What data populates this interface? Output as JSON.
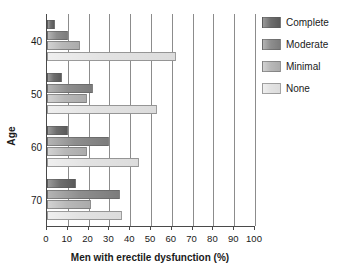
{
  "chart_data": {
    "type": "bar",
    "orientation": "horizontal",
    "title": "",
    "xlabel": "Men with erectile dysfunction (%)",
    "ylabel": "Age",
    "categories": [
      "40",
      "50",
      "60",
      "70"
    ],
    "xticks": [
      0,
      10,
      20,
      30,
      40,
      50,
      60,
      70,
      80,
      90,
      100
    ],
    "xlim": [
      0,
      100
    ],
    "grid": "vertical",
    "legend_position": "right",
    "series": [
      {
        "name": "Complete",
        "color": "#6e6e6e",
        "values": [
          4,
          7,
          10,
          14
        ]
      },
      {
        "name": "Moderate",
        "color": "#8e8e8e",
        "values": [
          10,
          22,
          30,
          35
        ]
      },
      {
        "name": "Minimal",
        "color": "#b8b8b8",
        "values": [
          16,
          19,
          19,
          21
        ]
      },
      {
        "name": "None",
        "color": "#e2e2e2",
        "values": [
          62,
          53,
          44,
          36
        ]
      }
    ]
  },
  "legend": {
    "items": [
      {
        "label": "Complete"
      },
      {
        "label": "Moderate"
      },
      {
        "label": "Minimal"
      },
      {
        "label": "None"
      }
    ]
  },
  "axes": {
    "x_title": "Men with erectile dysfunction (%)",
    "y_title": "Age"
  }
}
